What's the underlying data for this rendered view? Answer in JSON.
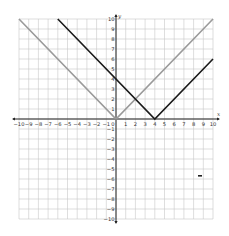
{
  "chart_data": {
    "type": "line",
    "title": "",
    "xlabel": "x",
    "ylabel": "y",
    "xlim": [
      -10,
      10
    ],
    "ylim": [
      -10,
      10
    ],
    "grid": true,
    "x_ticks": [
      -10,
      -9,
      -8,
      -7,
      -6,
      -5,
      -4,
      -3,
      -2,
      -1,
      1,
      2,
      3,
      4,
      5,
      6,
      7,
      8,
      9,
      10
    ],
    "y_ticks": [
      -10,
      -9,
      -8,
      -7,
      -6,
      -5,
      -4,
      -3,
      -2,
      -1,
      1,
      2,
      3,
      4,
      5,
      6,
      7,
      8,
      9,
      10
    ],
    "origin_label": "0",
    "series": [
      {
        "name": "y = |x|",
        "color": "#9a9a9a",
        "points": [
          [
            -10,
            10
          ],
          [
            0,
            0
          ],
          [
            10,
            10
          ]
        ]
      },
      {
        "name": "y = |x - 4|",
        "color": "#1a1a1a",
        "points": [
          [
            -6,
            10
          ],
          [
            4,
            0
          ],
          [
            10,
            6
          ]
        ]
      }
    ],
    "annotations": [
      {
        "type": "intersection",
        "x": 2,
        "y": 2
      }
    ]
  },
  "labels": {
    "x_axis": "x",
    "y_axis": "y",
    "origin": "0"
  }
}
